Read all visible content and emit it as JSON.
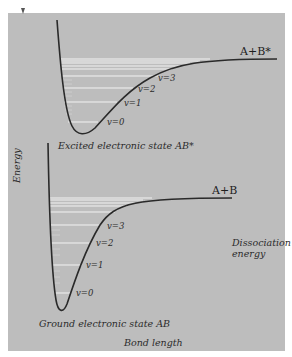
{
  "diagram": {
    "type": "potential-energy-curves",
    "axes": {
      "y_label": "Energy",
      "x_label": "Bond length"
    },
    "curves": [
      {
        "name": "excited",
        "state_label": "Excited electronic state AB*",
        "asymptote_label": "A+B*",
        "levels": [
          "v=0",
          "v=1",
          "v=2",
          "v=3"
        ]
      },
      {
        "name": "ground",
        "state_label": "Ground electronic state AB",
        "asymptote_label": "A+B",
        "levels": [
          "v=0",
          "v=1",
          "v=2",
          "v=3"
        ]
      }
    ],
    "annotation": {
      "line1": "Dissociation",
      "line2": "energy"
    },
    "colors": {
      "background": "#bdbdbd",
      "curve": "#2a2a2a",
      "levels": "#f2f2f2",
      "page": "#ffffff"
    }
  }
}
